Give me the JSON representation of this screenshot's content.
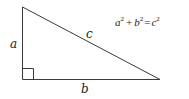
{
  "diagram": {
    "labels": {
      "leg_a": "a",
      "leg_b": "b",
      "hypotenuse": "c"
    },
    "formula": {
      "a": "a",
      "b": "b",
      "c": "c",
      "exp": "2",
      "plus": "+",
      "equals": "="
    },
    "colors": {
      "line": "#3a3a3a",
      "text": "#1a1a1a",
      "background": "#ffffff"
    }
  }
}
